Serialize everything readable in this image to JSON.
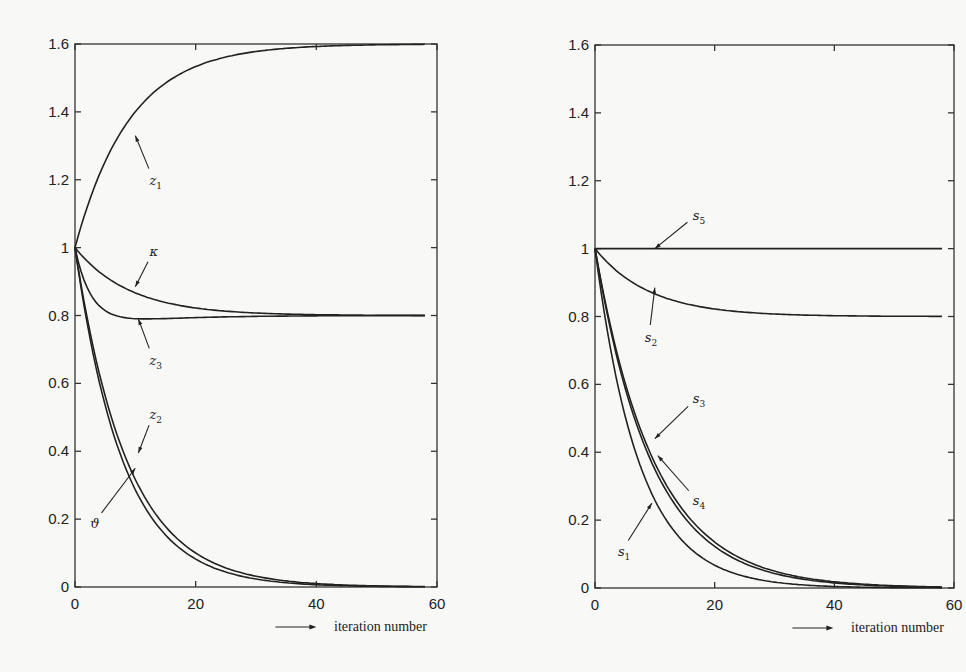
{
  "chart_data": [
    {
      "type": "line",
      "panel": "left",
      "title": "",
      "xlabel": "iteration number",
      "ylabel": "",
      "xlim": [
        0,
        60
      ],
      "ylim": [
        0,
        1.6
      ],
      "xticks": [
        0,
        20,
        40,
        60
      ],
      "yticks": [
        0,
        0.2,
        0.4,
        0.6,
        0.8,
        1,
        1.2,
        1.4,
        1.6
      ],
      "ytick_labels": [
        "0",
        "0.2",
        "0.4",
        "0.6",
        "0.8",
        "1",
        "1.2",
        "1.4",
        "1.6"
      ],
      "xtick_labels": [
        "0",
        "20",
        "40",
        "60"
      ],
      "grid": false,
      "legend": "inline arrow annotations",
      "series": [
        {
          "name": "z1",
          "label_base": "z",
          "label_sub": "1",
          "start": 1.0,
          "final": 1.6,
          "rate": 0.11,
          "shape": "exp",
          "label_xy": [
            13,
            1.2
          ],
          "arrow_to": [
            10,
            1.33
          ]
        },
        {
          "name": "κ",
          "label_base": "κ",
          "label_sub": "",
          "start": 1.0,
          "final": 0.8,
          "rate": 0.11,
          "shape": "exp",
          "label_xy": [
            13,
            0.99
          ],
          "arrow_to": [
            10,
            0.885
          ]
        },
        {
          "name": "z3",
          "label_base": "z",
          "label_sub": "3",
          "start": 1.0,
          "final": 0.8,
          "rate": 0.35,
          "shape": "overshoot",
          "dip": 0.785,
          "label_xy": [
            13,
            0.67
          ],
          "arrow_to": [
            10.5,
            0.79
          ]
        },
        {
          "name": "z2",
          "label_base": "z",
          "label_sub": "2",
          "start": 1.0,
          "final": 0.0,
          "rate": 0.115,
          "shape": "exp",
          "label_xy": [
            13,
            0.51
          ],
          "arrow_to": [
            10.5,
            0.395
          ]
        },
        {
          "name": "ϑ",
          "label_base": "ϑ",
          "label_sub": "",
          "start": 1.0,
          "final": 0.0,
          "rate": 0.125,
          "shape": "exp",
          "label_xy": [
            3.2,
            0.19
          ],
          "arrow_to": [
            10,
            0.35
          ]
        }
      ]
    },
    {
      "type": "line",
      "panel": "right",
      "title": "",
      "xlabel": "iteration number",
      "ylabel": "",
      "xlim": [
        0,
        60
      ],
      "ylim": [
        0,
        1.6
      ],
      "xticks": [
        0,
        20,
        40,
        60
      ],
      "yticks": [
        0,
        0.2,
        0.4,
        0.6,
        0.8,
        1,
        1.2,
        1.4,
        1.6
      ],
      "ytick_labels": [
        "0",
        "0.2",
        "0.4",
        "0.6",
        "0.8",
        "1",
        "1.2",
        "1.4",
        "1.6"
      ],
      "xtick_labels": [
        "0",
        "20",
        "40",
        "60"
      ],
      "grid": false,
      "legend": "inline arrow annotations",
      "series": [
        {
          "name": "s5",
          "label_base": "s",
          "label_sub": "5",
          "start": 1.0,
          "final": 1.0,
          "rate": 0.1,
          "shape": "exp",
          "label_xy": [
            17,
            1.1
          ],
          "arrow_to": [
            10,
            1.0
          ]
        },
        {
          "name": "s2",
          "label_base": "s",
          "label_sub": "2",
          "start": 1.0,
          "final": 0.8,
          "rate": 0.11,
          "shape": "exp",
          "label_xy": [
            9,
            0.74
          ],
          "arrow_to": [
            10,
            0.885
          ]
        },
        {
          "name": "s3",
          "label_base": "s",
          "label_sub": "3",
          "start": 1.0,
          "final": 0.0,
          "rate": 0.1,
          "shape": "exp",
          "label_xy": [
            17,
            0.56
          ],
          "arrow_to": [
            10,
            0.44
          ]
        },
        {
          "name": "s4",
          "label_base": "s",
          "label_sub": "4",
          "start": 1.0,
          "final": 0.0,
          "rate": 0.105,
          "shape": "exp",
          "label_xy": [
            17,
            0.26
          ],
          "arrow_to": [
            10.5,
            0.39
          ]
        },
        {
          "name": "s1",
          "label_base": "s",
          "label_sub": "1",
          "start": 1.0,
          "final": 0.0,
          "rate": 0.135,
          "shape": "exp",
          "label_xy": [
            4.5,
            0.11
          ],
          "arrow_to": [
            9.5,
            0.25
          ]
        }
      ]
    }
  ],
  "panels": {
    "left": {
      "x0": 75,
      "x1": 437,
      "y0": 44,
      "y1": 587
    },
    "right": {
      "x0": 595,
      "x1": 954,
      "y0": 45,
      "y1": 588
    }
  }
}
